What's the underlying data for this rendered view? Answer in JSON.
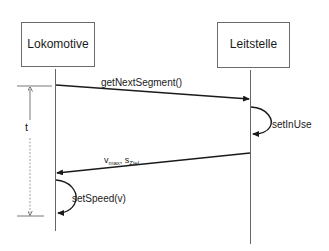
{
  "diagram": {
    "type": "sequence-diagram",
    "participants": [
      {
        "id": "lokomotive",
        "label": "Lokomotive"
      },
      {
        "id": "leitstelle",
        "label": "Leitstelle"
      }
    ],
    "messages": [
      {
        "from": "lokomotive",
        "to": "leitstelle",
        "label": "getNextSegment()",
        "kind": "call"
      },
      {
        "from": "leitstelle",
        "to": "leitstelle",
        "label": "setInUse",
        "kind": "self"
      },
      {
        "from": "leitstelle",
        "to": "lokomotive",
        "label_main_1": "v",
        "label_sub_1": "max",
        "label_sep": ", ",
        "label_main_2": "s",
        "label_sub_2": "Ziel",
        "kind": "return"
      },
      {
        "from": "lokomotive",
        "to": "lokomotive",
        "label": "setSpeed(v)",
        "kind": "self"
      }
    ],
    "time_bracket": {
      "label": "t"
    },
    "colors": {
      "line": "#1a1a1a",
      "lifeline": "#555555",
      "box_border": "#6b6b6b",
      "background": "#ffffff"
    }
  }
}
